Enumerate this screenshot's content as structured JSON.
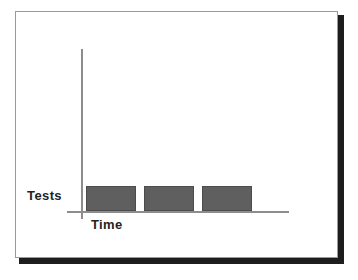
{
  "figure": {
    "frame_border_color": "#9a9a9a",
    "shadow_color": "#1d1d1d",
    "background_color": "#ffffff"
  },
  "chart_data": {
    "type": "bar",
    "title": "",
    "xlabel": "Time",
    "ylabel": "Tests",
    "categories": [
      "",
      "",
      ""
    ],
    "values": [
      1,
      1,
      1
    ],
    "ylim": [
      0,
      6
    ],
    "xlim": [
      0,
      6
    ],
    "grid": false,
    "legend": null,
    "axis_color": "#8d8d8d",
    "bar_fill_color": "#5f5f5f",
    "bar_border_color": "#4c4c4c",
    "annotations": []
  },
  "labels": {
    "y_axis": "Tests",
    "x_axis": "Time"
  }
}
